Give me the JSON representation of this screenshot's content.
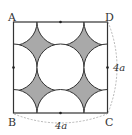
{
  "figure": {
    "type": "geometry-diagram",
    "vertices": {
      "A": "A",
      "B": "B",
      "C": "C",
      "D": "D"
    },
    "side_labels": {
      "right": "4a",
      "bottom": "4a"
    },
    "colors": {
      "shade": "#a9a9a9",
      "stroke": "#333333",
      "dash": "#999999"
    }
  }
}
